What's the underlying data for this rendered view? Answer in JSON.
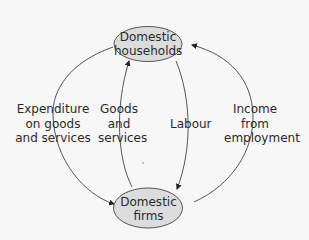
{
  "diagram": {
    "nodes": [
      {
        "id": "households",
        "lines": [
          "Domestic",
          "households"
        ]
      },
      {
        "id": "firms",
        "lines": [
          "Domestic",
          "firms"
        ]
      }
    ],
    "flows": [
      {
        "id": "expenditure",
        "from": "households",
        "to": "firms",
        "lines": [
          "Expenditure",
          "on goods",
          "and services"
        ]
      },
      {
        "id": "goods-services",
        "from": "firms",
        "to": "households",
        "lines": [
          "Goods",
          "and",
          "services"
        ]
      },
      {
        "id": "labour",
        "from": "households",
        "to": "firms",
        "lines": [
          "Labour"
        ]
      },
      {
        "id": "income",
        "from": "firms",
        "to": "households",
        "lines": [
          "Income",
          "from",
          "employment"
        ]
      }
    ],
    "colors": {
      "node_fill": "#dcdcdc",
      "stroke": "#555555",
      "text": "#2a2a2a",
      "background": "#f7f7f7"
    }
  }
}
